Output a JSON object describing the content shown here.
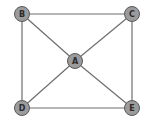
{
  "diagram": {
    "type": "graph",
    "directed": false,
    "nodes": [
      {
        "id": "A",
        "label": "A"
      },
      {
        "id": "B",
        "label": "B"
      },
      {
        "id": "C",
        "label": "C"
      },
      {
        "id": "D",
        "label": "D"
      },
      {
        "id": "E",
        "label": "E"
      }
    ],
    "edges": [
      {
        "from": "B",
        "to": "C"
      },
      {
        "from": "B",
        "to": "D"
      },
      {
        "from": "C",
        "to": "E"
      },
      {
        "from": "D",
        "to": "E"
      },
      {
        "from": "B",
        "to": "A"
      },
      {
        "from": "C",
        "to": "A"
      },
      {
        "from": "D",
        "to": "A"
      },
      {
        "from": "E",
        "to": "A"
      }
    ],
    "colors": {
      "node_fill": "#9b9b9b",
      "node_stroke": "#5a5a5a",
      "edge": "#6e6e6e",
      "label": "#2a2a2a"
    }
  }
}
